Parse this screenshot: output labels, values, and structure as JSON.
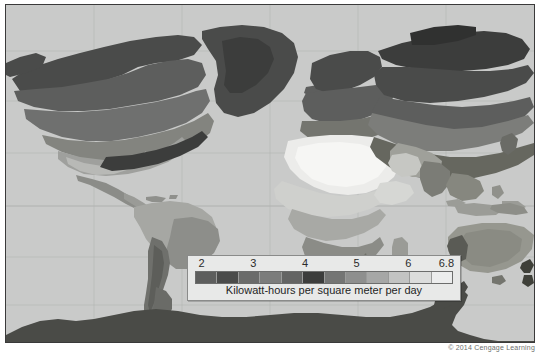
{
  "figure": {
    "kind": "world-map",
    "credit": "© 2014 Cengage Learning",
    "ocean_color": "#c9cac9",
    "frame_color": "#3a3a3a"
  },
  "legend": {
    "caption": "Kilowatt-hours per square meter per day",
    "tick_labels": [
      "2",
      "3",
      "4",
      "5",
      "6",
      "6.8"
    ],
    "tick_positions_pct": [
      5,
      24,
      43,
      62,
      81,
      95
    ],
    "swatches": [
      "#5d5e5d",
      "#4a4b4a",
      "#6a6b6a",
      "#7b7c7b",
      "#636463",
      "#3c3d3c",
      "#747574",
      "#8e8f8e",
      "#a6a7a6",
      "#c2c3c2",
      "#dcdddc",
      "#eceded"
    ],
    "background": "#e8e9e8",
    "border": "#8a8b8a"
  },
  "chart_data": {
    "type": "heatmap",
    "title": "",
    "xlabel": "",
    "ylabel": "",
    "legend_label": "Kilowatt-hours per square meter per day",
    "unit": "kWh/m²/day",
    "value_range": [
      2,
      6.8
    ],
    "tick_values": [
      2,
      3,
      4,
      5,
      6,
      6.8
    ],
    "grid": true,
    "legend_position": "bottom-center",
    "colormap": "grayscale-banded",
    "regions": [
      {
        "name": "Sahara / North Africa",
        "value": 6.8
      },
      {
        "name": "Arabian Peninsula",
        "value": 6.4
      },
      {
        "name": "Southwestern United States",
        "value": 6.0
      },
      {
        "name": "Central Australia",
        "value": 6.0
      },
      {
        "name": "Southern Africa / Kalahari",
        "value": 6.2
      },
      {
        "name": "Andes / Atacama",
        "value": 6.0
      },
      {
        "name": "Central Asia / Tibet",
        "value": 5.6
      },
      {
        "name": "Mexico",
        "value": 5.6
      },
      {
        "name": "Amazon Basin",
        "value": 4.6
      },
      {
        "name": "Central Africa",
        "value": 4.6
      },
      {
        "name": "India",
        "value": 5.2
      },
      {
        "name": "Southern Europe",
        "value": 4.2
      },
      {
        "name": "Eastern China",
        "value": 3.8
      },
      {
        "name": "Central United States",
        "value": 4.6
      },
      {
        "name": "Eastern United States",
        "value": 4.0
      },
      {
        "name": "Southern Canada",
        "value": 3.4
      },
      {
        "name": "Northern Europe",
        "value": 3.0
      },
      {
        "name": "Siberia",
        "value": 2.6
      },
      {
        "name": "Northern Canada",
        "value": 2.4
      },
      {
        "name": "Greenland",
        "value": 2.2
      },
      {
        "name": "Patagonia",
        "value": 3.2
      },
      {
        "name": "Antarctica",
        "value": 2.0
      }
    ]
  }
}
